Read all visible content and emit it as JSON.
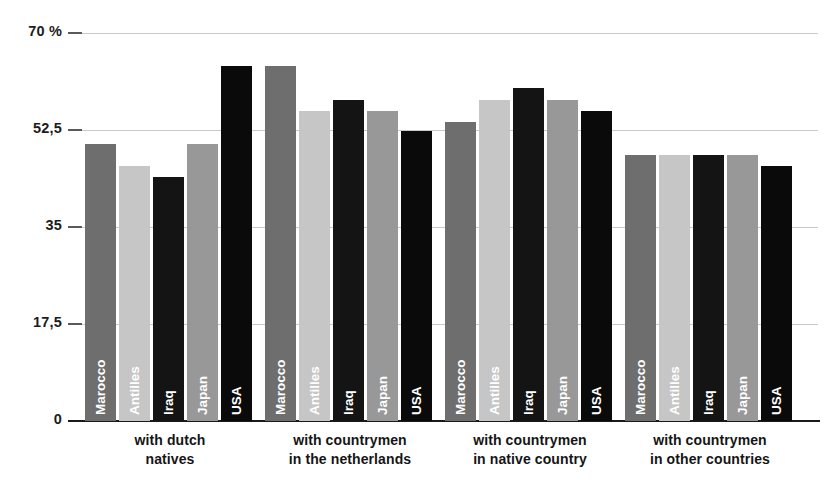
{
  "chart_data": {
    "type": "bar",
    "title": "",
    "subtitle": "",
    "xlabel": "",
    "ylabel": "",
    "ylim": [
      0,
      70
    ],
    "grid": true,
    "legend_position": "none",
    "y_unit": "%",
    "y_ticks": [
      {
        "label": "70 %",
        "value": 70
      },
      {
        "label": "52,5",
        "value": 52.5
      },
      {
        "label": "35",
        "value": 35
      },
      {
        "label": "17,5",
        "value": 17.5
      },
      {
        "label": "0",
        "value": 0
      }
    ],
    "categories": [
      {
        "line1": "with dutch",
        "line2": "natives"
      },
      {
        "line1": "with countrymen",
        "line2": "in the netherlands"
      },
      {
        "line1": "with countrymen",
        "line2": "in native country"
      },
      {
        "line1": "with countrymen",
        "line2": "in other countries"
      }
    ],
    "series": [
      {
        "name": "Marocco",
        "color": "#6e6e6e",
        "values": [
          50.0,
          64.0,
          54.0,
          48.0
        ]
      },
      {
        "name": "Antilles",
        "color": "#c6c6c6",
        "values": [
          46.0,
          56.0,
          58.0,
          48.0
        ]
      },
      {
        "name": "Iraq",
        "color": "#141414",
        "values": [
          44.0,
          58.0,
          60.0,
          48.0
        ]
      },
      {
        "name": "Japan",
        "color": "#989898",
        "values": [
          50.0,
          56.0,
          58.0,
          48.0
        ]
      },
      {
        "name": "USA",
        "color": "#0a0a0a",
        "values": [
          64.0,
          52.3,
          56.0,
          46.0
        ]
      }
    ],
    "colors": {
      "gridline": "#c9c9c9",
      "axis": "#1a1a1a",
      "text": "#151515",
      "bar_label_text": "#ffffff",
      "background": "#ffffff"
    }
  }
}
